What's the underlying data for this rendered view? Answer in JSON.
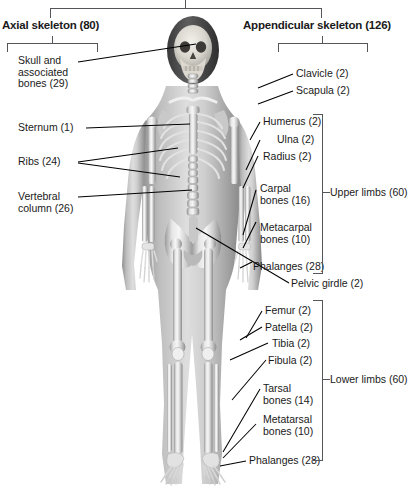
{
  "diagram": {
    "title_left": "Axial skeleton (80)",
    "title_right": "Appendicular skeleton (126)",
    "image_alt": "human-skeleton-anatomy",
    "total_note": ""
  },
  "axial_labels": [
    {
      "id": "skull",
      "text": "Skull and\nassociated\nbones (29)"
    },
    {
      "id": "sternum",
      "text": "Sternum (1)"
    },
    {
      "id": "ribs",
      "text": "Ribs (24)"
    },
    {
      "id": "vertebral-column",
      "text": "Vertebral\ncolumn (26)"
    }
  ],
  "appendicular_labels": [
    {
      "id": "clavicle",
      "text": "Clavicle (2)"
    },
    {
      "id": "scapula",
      "text": "Scapula (2)"
    },
    {
      "id": "humerus",
      "text": "Humerus (2)"
    },
    {
      "id": "ulna",
      "text": "Ulna (2)"
    },
    {
      "id": "radius",
      "text": "Radius (2)"
    },
    {
      "id": "carpal-bones",
      "text": "Carpal\nbones (16)"
    },
    {
      "id": "metacarpal-bones",
      "text": "Metacarpal\nbones (10)"
    },
    {
      "id": "phalanges-hand",
      "text": "Phalanges (28)"
    },
    {
      "id": "pelvic-girdle",
      "text": "Pelvic girdle (2)"
    },
    {
      "id": "femur",
      "text": "Femur (2)"
    },
    {
      "id": "patella",
      "text": "Patella (2)"
    },
    {
      "id": "tibia",
      "text": "Tibia (2)"
    },
    {
      "id": "fibula",
      "text": "Fibula (2)"
    },
    {
      "id": "tarsal-bones",
      "text": "Tarsal\nbones (14)"
    },
    {
      "id": "metatarsal-bones",
      "text": "Metatarsal\nbones (10)"
    },
    {
      "id": "phalanges-foot",
      "text": "Phalanges (28)"
    }
  ],
  "group_brackets": [
    {
      "id": "upper-limbs",
      "text": "Upper limbs (60)"
    },
    {
      "id": "lower-limbs",
      "text": "Lower limbs (60)"
    }
  ],
  "colors": {
    "text": "#1a1a1a",
    "bracket": "#55565a",
    "leader": "#000000",
    "background": "#ffffff"
  }
}
